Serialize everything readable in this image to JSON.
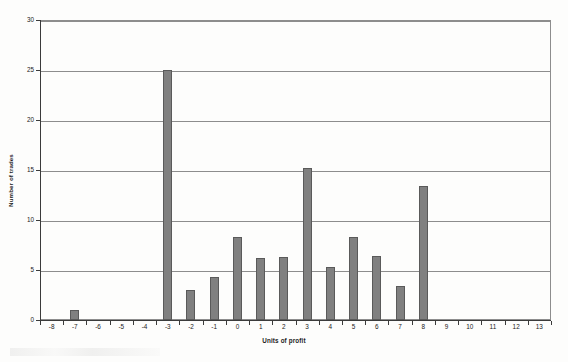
{
  "chart_data": {
    "type": "bar",
    "title": "",
    "subtitle": "",
    "xlabel": "Units of profit",
    "ylabel": "Number of trades",
    "categories": [
      "-8",
      "-7",
      "-6",
      "-5",
      "-4",
      "-3",
      "-2",
      "-1",
      "0",
      "1",
      "2",
      "3",
      "4",
      "5",
      "6",
      "7",
      "8",
      "9",
      "10",
      "11",
      "12",
      "13"
    ],
    "values": [
      0,
      1,
      0,
      0,
      0,
      25,
      3,
      4.3,
      8.3,
      6.2,
      6.3,
      15.2,
      5.3,
      8.3,
      6.4,
      3.4,
      13.4,
      0,
      0,
      0,
      0,
      0
    ],
    "ylim": [
      0,
      30
    ],
    "ytick_labels": [
      "0",
      "5",
      "10",
      "15",
      "20",
      "25",
      "30"
    ],
    "ytick_values": [
      0,
      5,
      10,
      15,
      20,
      25,
      30
    ],
    "grid": "horizontal",
    "legend": "none",
    "bar_color": "#808080",
    "bar_edge_color": "#5a5a5a",
    "axis_color": "#3b3b3b",
    "gridline_color": "#8d8d8d",
    "background_color": "#fdfdfc"
  }
}
